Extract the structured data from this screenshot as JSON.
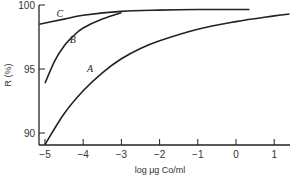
{
  "chart_data": {
    "type": "line",
    "title": "",
    "xlabel": "log μg Co/ml",
    "ylabel": "R (%)",
    "xlim": [
      -5,
      1.5
    ],
    "ylim": [
      89,
      100
    ],
    "xticks": [
      -5,
      -4,
      -3,
      -2,
      -1,
      0,
      1
    ],
    "xtick_labels": [
      "−5",
      "−4",
      "−3",
      "−2",
      "−1",
      "0",
      "1"
    ],
    "yticks": [
      90,
      95,
      100
    ],
    "ytick_labels": [
      "90",
      "95",
      "100"
    ],
    "grid": false,
    "legend": "inline curve labels",
    "series": [
      {
        "name": "C",
        "x": [
          -5.15,
          -4.5,
          -4,
          -3,
          -2,
          -1,
          0,
          0.35
        ],
        "y": [
          98.5,
          98.9,
          99.2,
          99.5,
          99.6,
          99.65,
          99.65,
          99.65
        ]
      },
      {
        "name": "B",
        "x": [
          -5.0,
          -4.75,
          -4.5,
          -4.25,
          -4.0,
          -3.5,
          -3.0
        ],
        "y": [
          93.9,
          95.6,
          96.8,
          97.6,
          98.2,
          98.9,
          99.4
        ]
      },
      {
        "name": "A",
        "x": [
          -5.0,
          -4.5,
          -4.0,
          -3.5,
          -3.0,
          -2.5,
          -2.0,
          -1.0,
          0.0,
          1.0,
          1.4
        ],
        "y": [
          89.1,
          91.5,
          93.3,
          94.7,
          95.8,
          96.6,
          97.2,
          98.1,
          98.7,
          99.15,
          99.3
        ]
      }
    ],
    "curve_labels": [
      {
        "text": "C",
        "x": -4.7,
        "y": 99.1
      },
      {
        "text": "B",
        "x": -4.35,
        "y": 97.0
      },
      {
        "text": "A",
        "x": -3.9,
        "y": 94.8
      }
    ]
  }
}
